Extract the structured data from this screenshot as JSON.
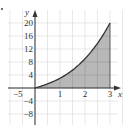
{
  "chart_data": {
    "type": "area",
    "title": "",
    "xlabel": "x",
    "ylabel": "y",
    "xlim": [
      -1.4,
      3.6
    ],
    "ylim": [
      -11,
      22
    ],
    "grid": true,
    "x_ticks": [
      1,
      2,
      3
    ],
    "x_tick_labels": [
      "1",
      "2",
      "3"
    ],
    "y_ticks": [
      -8,
      -4,
      4,
      8,
      12,
      16,
      20
    ],
    "y_tick_labels": [
      "−8",
      "−4",
      "4",
      "8",
      "12",
      "16",
      "20"
    ],
    "extra_label": "−5",
    "series": [
      {
        "name": "curve",
        "x": [
          0,
          0.5,
          1,
          1.5,
          2,
          2.5,
          3
        ],
        "values": [
          0,
          1.25,
          3,
          5.6,
          9,
          13.8,
          20
        ]
      }
    ],
    "shaded_region": {
      "x_from": 0,
      "x_to": 3,
      "description": "area under curve between x=0 and x=3"
    },
    "colors": {
      "fill": "#b8b8b8",
      "curve": "#333333",
      "grid": "#d8d8d8",
      "axis": "#333333"
    }
  }
}
